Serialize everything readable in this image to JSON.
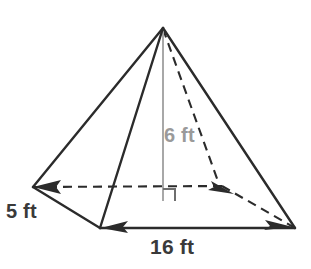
{
  "figure": {
    "name": "rectangular-pyramid-diagram",
    "shape": "rectangular pyramid",
    "background_color": "#ffffff",
    "edge_color": "#2b2b2b",
    "hidden_edge_color": "#2b2b2b",
    "height_line_color": "#9a9a9a",
    "labels": {
      "height": "6 ft",
      "width": "5 ft",
      "length": "16 ft"
    },
    "measurements": [
      {
        "name": "height",
        "value": 6,
        "unit": "ft",
        "text": "6 ft",
        "color": "#9a9a9a"
      },
      {
        "name": "base-width",
        "value": 5,
        "unit": "ft",
        "text": "5 ft",
        "color": "#3a3a3a"
      },
      {
        "name": "base-length",
        "value": 16,
        "unit": "ft",
        "text": "16 ft",
        "color": "#3a3a3a"
      }
    ],
    "vertices": {
      "apex": [
        163,
        27
      ],
      "back_left": [
        33,
        187
      ],
      "back_right": [
        222,
        186
      ],
      "front_left": [
        100,
        228
      ],
      "front_right": [
        295,
        228
      ],
      "height_foot": [
        163,
        200
      ]
    },
    "icons": {
      "right_angle": "right-angle-marker",
      "arrow_left": "arrowhead-left-icon",
      "arrow_right": "arrowhead-right-icon"
    }
  }
}
